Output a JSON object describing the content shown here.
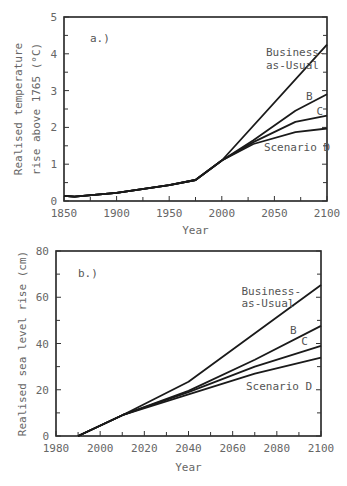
{
  "chart_data": [
    {
      "type": "line",
      "panel_label": "a.)",
      "title": "",
      "xlabel": "Year",
      "ylabel": [
        "Realised temperature",
        "rise above 1765 (°C)"
      ],
      "xlim": [
        1850,
        2100
      ],
      "ylim": [
        0,
        5
      ],
      "xticks": [
        1850,
        1900,
        1950,
        2000,
        2050,
        2100
      ],
      "xminor": [
        1875,
        1925,
        1975,
        2025,
        2075
      ],
      "yticks": [
        0,
        1,
        2,
        3,
        4,
        5
      ],
      "yminor": [
        0.5,
        1.5,
        2.5,
        3.5,
        4.5
      ],
      "grid": false,
      "series": [
        {
          "name": "Business-as-Usual",
          "x": [
            1850,
            1860,
            1900,
            1950,
            1975,
            2000,
            2100
          ],
          "values": [
            0.14,
            0.12,
            0.22,
            0.43,
            0.57,
            1.1,
            4.25
          ]
        },
        {
          "name": "B",
          "x": [
            1850,
            1860,
            1900,
            1950,
            1975,
            2000,
            2030,
            2070,
            2100
          ],
          "values": [
            0.14,
            0.12,
            0.22,
            0.43,
            0.57,
            1.1,
            1.65,
            2.45,
            2.9
          ]
        },
        {
          "name": "C",
          "x": [
            1850,
            1860,
            1900,
            1950,
            1975,
            2000,
            2030,
            2070,
            2100
          ],
          "values": [
            0.14,
            0.12,
            0.22,
            0.43,
            0.57,
            1.1,
            1.6,
            2.15,
            2.32
          ]
        },
        {
          "name": "Scenario D",
          "x": [
            1850,
            1860,
            1900,
            1950,
            1975,
            2000,
            2030,
            2070,
            2100
          ],
          "values": [
            0.14,
            0.12,
            0.22,
            0.43,
            0.57,
            1.1,
            1.55,
            1.87,
            1.97
          ]
        }
      ],
      "annotations": [
        {
          "text": "Business-",
          "x": 2042,
          "y": 3.95
        },
        {
          "text": "as-Usual",
          "x": 2042,
          "y": 3.6
        },
        {
          "text": "B",
          "x": 2080,
          "y": 2.75
        },
        {
          "text": "C",
          "x": 2090,
          "y": 2.35
        },
        {
          "text": "Scenario D",
          "x": 2040,
          "y": 1.35
        }
      ]
    },
    {
      "type": "line",
      "panel_label": "b.)",
      "title": "",
      "xlabel": "Year",
      "ylabel": [
        "Realised sea level rise (cm)"
      ],
      "xlim": [
        1980,
        2100
      ],
      "ylim": [
        0,
        80
      ],
      "xticks": [
        1980,
        2000,
        2020,
        2040,
        2060,
        2080,
        2100
      ],
      "xminor": [
        1990,
        2010,
        2030,
        2050,
        2070,
        2090
      ],
      "yticks": [
        0,
        20,
        40,
        60,
        80
      ],
      "yminor": [
        10,
        30,
        50,
        70
      ],
      "grid": false,
      "series": [
        {
          "name": "Business-as-Usual",
          "x": [
            1990,
            2010,
            2040,
            2100
          ],
          "values": [
            0,
            9,
            23.5,
            65.3
          ]
        },
        {
          "name": "B",
          "x": [
            1990,
            2010,
            2040,
            2070,
            2100
          ],
          "values": [
            0,
            9,
            19.5,
            33,
            47.6
          ]
        },
        {
          "name": "C",
          "x": [
            1990,
            2010,
            2040,
            2070,
            2100
          ],
          "values": [
            0,
            9,
            19,
            30,
            39
          ]
        },
        {
          "name": "Scenario D",
          "x": [
            1990,
            2010,
            2040,
            2070,
            2100
          ],
          "values": [
            0,
            9,
            18,
            27,
            33.9
          ]
        }
      ],
      "annotations": [
        {
          "text": "Business-",
          "x": 2064,
          "y": 61
        },
        {
          "text": "as-Usual",
          "x": 2064,
          "y": 56
        },
        {
          "text": "B",
          "x": 2086,
          "y": 44
        },
        {
          "text": "C",
          "x": 2091,
          "y": 39.5
        },
        {
          "text": "Scenario D",
          "x": 2066,
          "y": 20
        }
      ]
    }
  ]
}
